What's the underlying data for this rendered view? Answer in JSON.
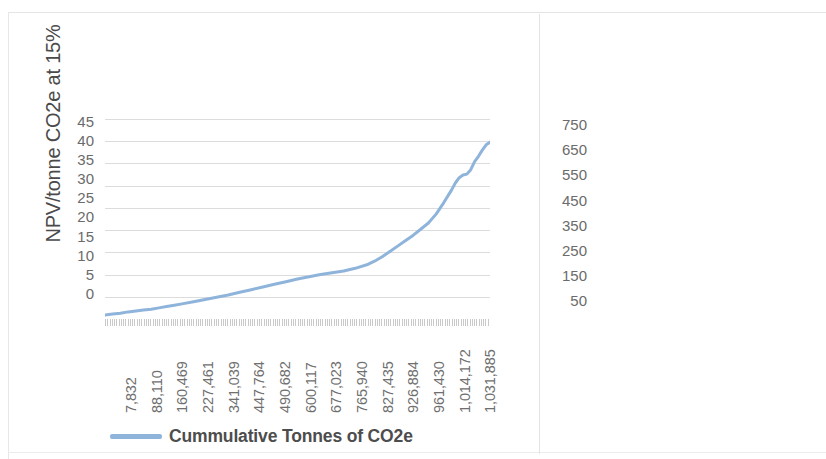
{
  "chart_data": [
    {
      "id": "left",
      "type": "line",
      "title": "",
      "xlabel": "",
      "ylabel": "NPV/tonne CO2e at 15%",
      "legend": [
        "Cummulative Tonnes of CO2e"
      ],
      "legend_position": "bottom",
      "grid": true,
      "ylim": [
        0,
        45
      ],
      "yticks": [
        45,
        40,
        35,
        30,
        25,
        20,
        15,
        10,
        5,
        0
      ],
      "xticklabels": [
        "7,832",
        "88,110",
        "160,469",
        "227,461",
        "341,039",
        "447,764",
        "490,682",
        "600,117",
        "677,023",
        "765,940",
        "827,435",
        "926,884",
        "961,430",
        "1,014,172",
        "1,031,885"
      ],
      "series": [
        {
          "name": "Cummulative Tonnes of CO2e",
          "color": "#8FB4DC",
          "x": [
            0,
            2,
            4,
            6,
            8,
            10,
            12,
            14,
            16,
            18,
            20,
            23,
            26,
            29,
            32,
            35,
            38,
            41,
            44,
            47,
            50,
            53,
            56,
            59,
            62,
            65,
            68,
            70,
            72,
            74,
            76,
            78,
            80,
            82,
            84,
            86,
            88,
            90,
            91,
            92,
            93,
            94,
            95,
            96,
            97,
            98,
            99,
            100
          ],
          "values": [
            0.9,
            1.1,
            1.3,
            1.6,
            1.8,
            2.0,
            2.2,
            2.5,
            2.8,
            3.1,
            3.4,
            3.9,
            4.4,
            4.9,
            5.4,
            6.0,
            6.6,
            7.2,
            7.8,
            8.4,
            9.0,
            9.5,
            10.0,
            10.4,
            10.8,
            11.4,
            12.2,
            13.0,
            14.0,
            15.2,
            16.4,
            17.6,
            18.8,
            20.2,
            21.6,
            23.6,
            26.2,
            29.0,
            30.6,
            31.8,
            32.4,
            32.6,
            33.6,
            35.4,
            36.6,
            38.0,
            39.2,
            39.8
          ]
        }
      ]
    },
    {
      "id": "right",
      "type": "line",
      "title": "",
      "xlabel": "",
      "ylabel": "",
      "grid": true,
      "ylim": [
        0,
        800
      ],
      "yticks": [
        750,
        650,
        550,
        450,
        350,
        250,
        150,
        50
      ],
      "xticklabels": [
        "1,051,915",
        "1,052,188",
        "1,052,419",
        "1,055,579",
        "1,058,345",
        "1,060,943",
        "1,067,571",
        "1,067,662",
        "1,067,844"
      ],
      "series": [
        {
          "name": "Cummulative Tonnes of CO2e",
          "color": "#8FB4DC",
          "x": [
            0,
            3,
            6,
            10,
            15,
            20,
            26,
            32,
            38,
            44,
            50,
            55,
            60,
            64,
            68,
            70,
            72,
            74,
            76,
            78,
            80,
            82,
            84,
            86,
            88,
            90,
            92,
            94,
            96,
            98,
            100
          ],
          "values": [
            35,
            38,
            42,
            45,
            48,
            50,
            52,
            55,
            58,
            62,
            66,
            70,
            74,
            80,
            86,
            92,
            96,
            98,
            100,
            104,
            120,
            140,
            150,
            155,
            158,
            160,
            175,
            260,
            430,
            600,
            680
          ]
        }
      ]
    }
  ],
  "left_chart": {
    "axis_title_y": "NPV/tonne CO2e at 15%"
  },
  "legend": {
    "label": "Cummulative Tonnes of CO2e",
    "color": "#8FB4DC"
  }
}
